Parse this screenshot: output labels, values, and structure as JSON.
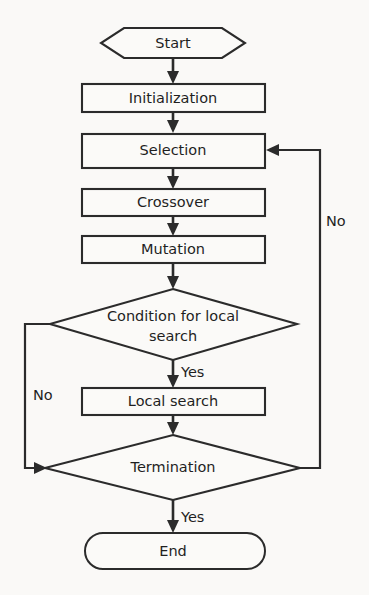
{
  "diagram": {
    "background_color": "#faf9f7",
    "line_color": "#2b2b2b",
    "node_fill": "#fbfaf8",
    "nodes": {
      "start": {
        "label": "Start",
        "shape": "hexagon"
      },
      "initialization": {
        "label": "Initialization",
        "shape": "rectangle"
      },
      "selection": {
        "label": "Selection",
        "shape": "rectangle"
      },
      "crossover": {
        "label": "Crossover",
        "shape": "rectangle"
      },
      "mutation": {
        "label": "Mutation",
        "shape": "rectangle"
      },
      "condition": {
        "label_line1": "Condition for local",
        "label_line2": "search",
        "shape": "diamond"
      },
      "local_search": {
        "label": "Local search",
        "shape": "rectangle"
      },
      "termination": {
        "label": "Termination",
        "shape": "diamond"
      },
      "end": {
        "label": "End",
        "shape": "stadium"
      }
    },
    "edge_labels": {
      "condition_yes": "Yes",
      "condition_no": "No",
      "termination_yes": "Yes",
      "termination_no": "No"
    }
  }
}
